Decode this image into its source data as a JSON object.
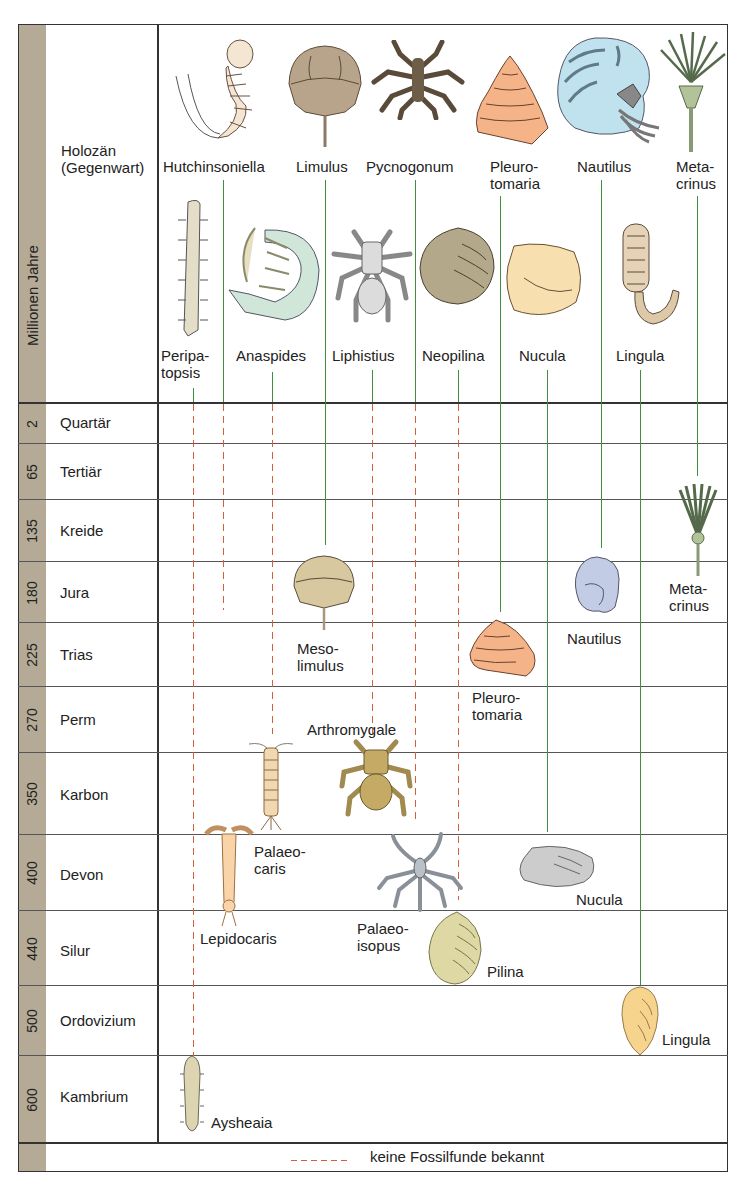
{
  "axis": {
    "title": "Millionen Jahre"
  },
  "present": {
    "line1": "Holozän",
    "line2": "(Gegenwart)"
  },
  "eras": [
    {
      "name": "Quartär",
      "ma": "2"
    },
    {
      "name": "Tertiär",
      "ma": "65"
    },
    {
      "name": "Kreide",
      "ma": "135"
    },
    {
      "name": "Jura",
      "ma": "180"
    },
    {
      "name": "Trias",
      "ma": "225"
    },
    {
      "name": "Perm",
      "ma": "270"
    },
    {
      "name": "Karbon",
      "ma": "350"
    },
    {
      "name": "Devon",
      "ma": "400"
    },
    {
      "name": "Silur",
      "ma": "440"
    },
    {
      "name": "Ordovizium",
      "ma": "500"
    },
    {
      "name": "Kambrium",
      "ma": "600"
    }
  ],
  "living_top": {
    "hutchinsoniella": "Hutchinsoniella",
    "limulus": "Limulus",
    "pycnogonum": "Pycnogonum",
    "pleurotomaria_1": "Pleuro-",
    "pleurotomaria_2": "tomaria",
    "nautilus": "Nautilus",
    "metacrinus_1": "Meta-",
    "metacrinus_2": "crinus"
  },
  "living_bottom": {
    "peripatopsis_1": "Peripa-",
    "peripatopsis_2": "topsis",
    "anaspides": "Anaspides",
    "liphistius": "Liphistius",
    "neopilina": "Neopilina",
    "nucula": "Nucula",
    "lingula": "Lingula"
  },
  "fossils": {
    "mesolimulus_1": "Meso-",
    "mesolimulus_2": "limulus",
    "pleurotomaria_1": "Pleuro-",
    "pleurotomaria_2": "tomaria",
    "nautilus": "Nautilus",
    "metacrinus_1": "Meta-",
    "metacrinus_2": "crinus",
    "arthromygale": "Arthromygale",
    "palaeocaris_1": "Palaeo-",
    "palaeocaris_2": "caris",
    "lepidocaris": "Lepidocaris",
    "palaeoisopus_1": "Palaeo-",
    "palaeoisopus_2": "isopus",
    "nucula": "Nucula",
    "pilina": "Pilina",
    "lingula": "Lingula",
    "aysheaia": "Aysheaia"
  },
  "legend": {
    "dashed_label": "keine Fossilfunde bekannt"
  },
  "colors": {
    "solid_line": "#3f8f3f",
    "dashed_line": "#d2603a",
    "strip": "#b4aa96"
  }
}
